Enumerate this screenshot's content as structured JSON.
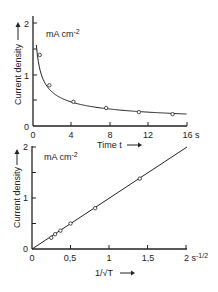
{
  "chart_data": [
    {
      "type": "line",
      "title": "",
      "unit_label": "mA cm⁻²",
      "xlabel": "Time t",
      "ylabel": "Current density",
      "x_unit": "s",
      "xlim": [
        0,
        16
      ],
      "ylim": [
        0,
        2
      ],
      "x_ticks": [
        "0",
        "4",
        "8",
        "12",
        "16 s"
      ],
      "y_ticks": [
        "0",
        "1",
        "2"
      ],
      "grid": false,
      "series": [
        {
          "name": "measured",
          "x": [
            0.7,
            1.7,
            4.2,
            7.6,
            11.0,
            14.5
          ],
          "y": [
            1.38,
            0.79,
            0.47,
            0.35,
            0.27,
            0.23
          ]
        }
      ]
    },
    {
      "type": "line",
      "title": "",
      "unit_label": "mA cm⁻²",
      "xlabel": "1/√t",
      "ylabel": "Current density",
      "x_unit": "s⁻¹ᐟ²",
      "xlim": [
        0,
        2
      ],
      "ylim": [
        0,
        2
      ],
      "x_ticks": [
        "0",
        "0,5",
        "1",
        "1,5",
        "2 s⁻¹ᐟ²"
      ],
      "y_ticks": [
        "0",
        "1",
        "2"
      ],
      "grid": false,
      "series": [
        {
          "name": "measured",
          "x": [
            0.25,
            0.3,
            0.37,
            0.5,
            0.82,
            1.4
          ],
          "y": [
            0.22,
            0.29,
            0.36,
            0.5,
            0.8,
            1.38
          ]
        }
      ]
    }
  ],
  "labels": {
    "top_unit": "mA cm",
    "top_unit_exp": "-2",
    "top_xlabel": "Time t",
    "top_ylabel": "Current density",
    "top_xt": [
      "0",
      "4",
      "8",
      "12",
      "16 s"
    ],
    "top_yt": [
      "0",
      "1",
      "2"
    ],
    "bot_unit": "mA cm",
    "bot_unit_exp": "-2",
    "bot_xlabel": "1/√T",
    "bot_ylabel": "Current density",
    "bot_xt": [
      "0",
      "0,5",
      "1",
      "1,5",
      "2 s"
    ],
    "bot_xt_exp": "-1/2",
    "bot_yt": [
      "0",
      "1",
      "2"
    ]
  }
}
